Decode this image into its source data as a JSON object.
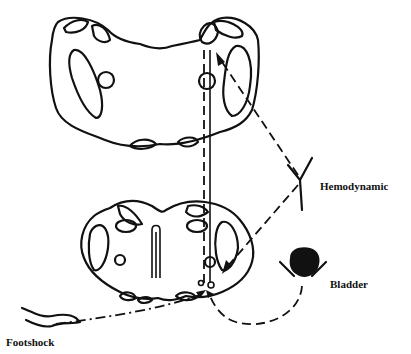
{
  "diagram": {
    "type": "neural pathway schematic",
    "sections": [
      "upper-brainstem-section",
      "lower-brainstem-section"
    ],
    "labels": {
      "hemodynamic": "Hemodynamic",
      "bladder": "Bladder",
      "footshock": "Footshock"
    },
    "inputs": [
      {
        "name": "Hemodynamic",
        "line_style": "long-dash",
        "target": "upper-section"
      },
      {
        "name": "Bladder",
        "line_style": "dash",
        "target": "lower-section"
      },
      {
        "name": "Footshock",
        "line_style": "dash-dot",
        "target": "lower-section"
      }
    ],
    "colors": {
      "ink": "#111111",
      "background": "#ffffff"
    }
  }
}
